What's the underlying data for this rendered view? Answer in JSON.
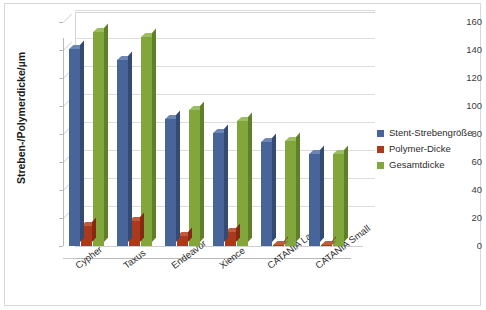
{
  "chart": {
    "y_axis_title": "Streben-/Polymerdicke/µm",
    "y_ticks": [
      "0",
      "20",
      "40",
      "60",
      "80",
      "100",
      "120",
      "140",
      "160"
    ],
    "legend": [
      {
        "label": "Stent-Strebengröße",
        "color": "#48659a"
      },
      {
        "label": "Polymer-Dicke",
        "color": "#ab3a1c"
      },
      {
        "label": "Gesamtdicke",
        "color": "#80a63c"
      }
    ]
  },
  "chart_data": {
    "type": "bar",
    "title": "",
    "xlabel": "",
    "ylabel": "Streben-/Polymerdicke/µm",
    "ylim": [
      0,
      160
    ],
    "ytick_step": 20,
    "grid": true,
    "legend_position": "right",
    "three_d": true,
    "categories": [
      "Cypher",
      "Taxus",
      "Endeavor",
      "Xience",
      "CATANIA Large",
      "CATANIA Small"
    ],
    "series": [
      {
        "name": "Stent-Strebengröße",
        "color": "#48659a",
        "values": [
          141,
          133,
          91,
          81,
          74,
          66
        ]
      },
      {
        "name": "Polymer-Dicke",
        "color": "#ab3a1c",
        "values": [
          14,
          18,
          7,
          10,
          0.5,
          0.5
        ]
      },
      {
        "name": "Gesamtdicke",
        "color": "#80a63c",
        "values": [
          153,
          149,
          97,
          89,
          75,
          66
        ]
      }
    ]
  }
}
